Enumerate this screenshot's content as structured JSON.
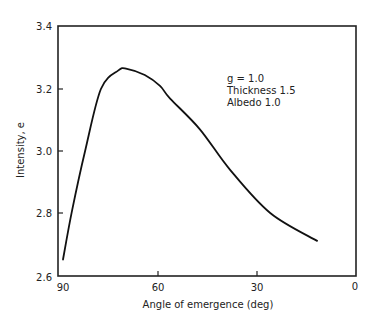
{
  "chart_data": {
    "type": "line",
    "title": "",
    "xlabel": "Angle of emergence (deg)",
    "ylabel": "Intensity, e",
    "xlim": [
      90,
      0
    ],
    "ylim": [
      2.6,
      3.4
    ],
    "x_reversed": true,
    "xticks": [
      90,
      60,
      30,
      0
    ],
    "xtick_labels": [
      "90",
      "60",
      "30",
      "0"
    ],
    "yticks": [
      2.6,
      2.8,
      3.0,
      3.2,
      3.4
    ],
    "ytick_labels": [
      "2.6",
      "2.8",
      "3.0",
      "3.2",
      "3.4"
    ],
    "grid": false,
    "legend": null,
    "annotations": [
      "g = 1.0",
      "Thickness 1.5",
      "Albedo 1.0"
    ],
    "series": [
      {
        "name": "Intensity",
        "x": [
          88.8,
          86.0,
          82.1,
          77.3,
          72.0,
          69.4,
          64.0,
          59.4,
          56.4,
          47.3,
          38.2,
          26.0,
          11.8
        ],
        "y": [
          2.65,
          2.81,
          3.0,
          3.2,
          3.26,
          3.265,
          3.245,
          3.21,
          3.17,
          3.07,
          2.94,
          2.8,
          2.71
        ]
      }
    ]
  },
  "labels": {
    "xlabel": "Angle of emergence (deg)",
    "ylabel": "Intensity, e",
    "annotation_line1": "g = 1.0",
    "annotation_line2": "Thickness 1.5",
    "annotation_line3": "Albedo 1.0",
    "xtick_90": "90",
    "xtick_60": "60",
    "xtick_30": "30",
    "xtick_0": "0",
    "ytick_26": "2.6",
    "ytick_28": "2.8",
    "ytick_30": "3.0",
    "ytick_32": "3.2",
    "ytick_34": "3.4"
  }
}
